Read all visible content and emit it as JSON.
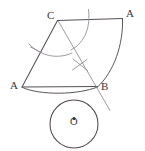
{
  "figure": {
    "background_color": "#ffffff",
    "ink_color": "#555055",
    "construction_color": "#8d888d",
    "labels": {
      "vertex_c": "C",
      "vertex_a_top": "A",
      "vertex_a_left": "A",
      "vertex_b": "B",
      "circle_center": "O"
    },
    "points": {
      "C": {
        "x": 57,
        "y": 20
      },
      "A_top": {
        "x": 122,
        "y": 18
      },
      "A_left": {
        "x": 22,
        "y": 87
      },
      "B": {
        "x": 97,
        "y": 87
      },
      "O": {
        "x": 74,
        "y": 124
      },
      "cross_mark": {
        "x": 80,
        "y": 65
      },
      "tick_mark": {
        "x": 35,
        "y": 50
      }
    },
    "circle": {
      "center_x": 74,
      "center_y": 124,
      "radius": 24,
      "center_dot_radius": 1.6
    },
    "segments": [
      {
        "name": "top-edge-C-to-A",
        "from": "C",
        "to": "A_top"
      },
      {
        "name": "left-edge-C-to-A",
        "from": "C",
        "to": "A_left"
      },
      {
        "name": "bottom-edge-A-to-B",
        "from": "A_left",
        "to": "B"
      },
      {
        "name": "construction-ray-C-through-B",
        "from": "C",
        "to": "below-B"
      }
    ],
    "arcs": [
      {
        "name": "major-arc-A-to-B",
        "from": "A_top",
        "to": "B"
      },
      {
        "name": "minor-arc-A-to-B-bulge",
        "from": "A_left",
        "to": "B"
      },
      {
        "name": "compass-arc-near-C",
        "description": "short construction arc swung from C"
      },
      {
        "name": "compass-arc-left",
        "description": "short construction arc crossing left edge"
      }
    ]
  }
}
